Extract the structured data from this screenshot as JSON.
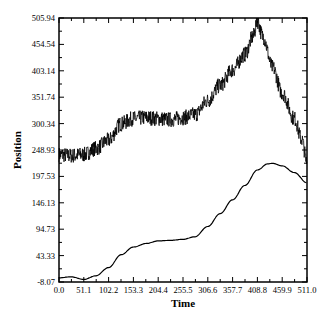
{
  "chart_data": {
    "type": "line",
    "title": "",
    "xlabel": "Time",
    "ylabel": "Position",
    "xlim": [
      0.0,
      511.0
    ],
    "ylim": [
      -8.07,
      505.94
    ],
    "x_ticks": [
      "0.0",
      "51.1",
      "102.2",
      "153.3",
      "204.4",
      "255.5",
      "306.6",
      "357.7",
      "408.8",
      "459.9",
      "511.0"
    ],
    "y_ticks": [
      "-8.07",
      "43.33",
      "94.73",
      "146.13",
      "197.53",
      "248.93",
      "300.34",
      "351.74",
      "403.14",
      "454.54",
      "505.94"
    ],
    "grid": false,
    "legend": null,
    "series": [
      {
        "name": "noisy trajectory",
        "style": "noisy",
        "x": [
          0,
          25,
          51.1,
          76,
          102.2,
          128,
          153.3,
          180,
          204.4,
          230,
          255.5,
          280,
          306.6,
          332,
          357.7,
          383,
          400,
          408.8,
          420,
          440,
          459.9,
          485,
          500,
          511
        ],
        "values": [
          240,
          238,
          240,
          252,
          268,
          300,
          310,
          312,
          310,
          308,
          312,
          318,
          345,
          375,
          405,
          435,
          470,
          500,
          470,
          410,
          360,
          310,
          270,
          225
        ]
      },
      {
        "name": "smoothed trajectory",
        "style": "smooth",
        "x": [
          0,
          25,
          51.1,
          76,
          102.2,
          128,
          153.3,
          180,
          204.4,
          230,
          255.5,
          280,
          306.6,
          332,
          357.7,
          383,
          408.8,
          430,
          440,
          459.9,
          485,
          511
        ],
        "values": [
          0,
          2,
          -3,
          4,
          20,
          45,
          60,
          67,
          72,
          73,
          75,
          80,
          100,
          125,
          152,
          180,
          210,
          222,
          223,
          218,
          205,
          185
        ]
      }
    ]
  }
}
